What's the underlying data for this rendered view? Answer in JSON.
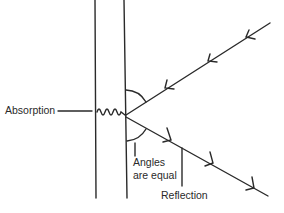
{
  "diagram": {
    "colors": {
      "stroke": "#2a2a2a",
      "background": "#ffffff"
    },
    "labels": {
      "absorption": "Absorption",
      "angles_line1": "Angles",
      "angles_line2": "are equal",
      "reflection": "Reflection"
    },
    "elements": {
      "surface": "vertical slab bounded by two parallel lines",
      "incident_ray": "ray from upper right toward surface, with 3 arrowheads",
      "reflected_ray": "ray from surface toward lower right, with 3 arrowheads",
      "absorption_wave": "wavy line inside slab",
      "angle_arcs": 2
    }
  }
}
